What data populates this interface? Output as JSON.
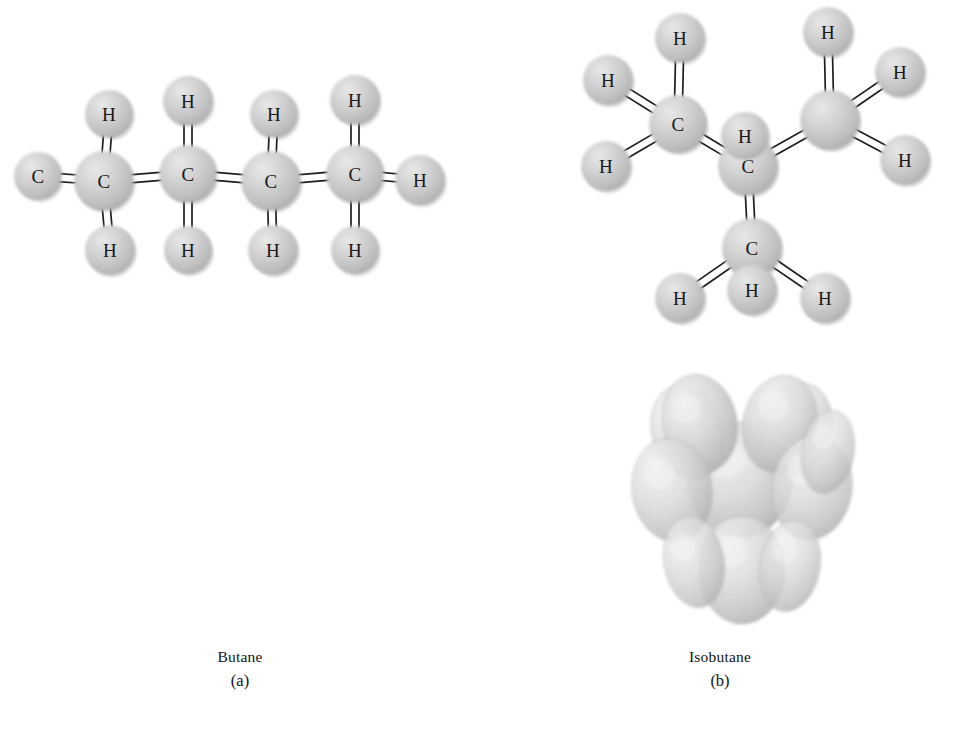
{
  "figure": {
    "background_color": "#ffffff",
    "atom_sphere_color": "#c9c9c9",
    "bond_color": "#ffffff",
    "bond_outline_color": "#1e1e1e",
    "label_color": "#191919"
  },
  "panels": [
    {
      "id": "a",
      "caption_name": "Butane",
      "caption_tag": "(a)",
      "ball_and_stick": {
        "atoms": [
          {
            "element": "C",
            "label": "C",
            "x": 38,
            "y": 176,
            "r": 24,
            "show_label": true
          },
          {
            "element": "C",
            "label": "C",
            "x": 104,
            "y": 181,
            "r": 30,
            "show_label": true
          },
          {
            "element": "C",
            "label": "C",
            "x": 188,
            "y": 174,
            "r": 29,
            "show_label": true
          },
          {
            "element": "C",
            "label": "C",
            "x": 271,
            "y": 181,
            "r": 30,
            "show_label": true
          },
          {
            "element": "C",
            "label": "C",
            "x": 355,
            "y": 174,
            "r": 29,
            "show_label": true
          },
          {
            "element": "H",
            "label": "H",
            "x": 109,
            "y": 114,
            "r": 24,
            "show_label": true
          },
          {
            "element": "H",
            "label": "H",
            "x": 110,
            "y": 250,
            "r": 25,
            "show_label": true
          },
          {
            "element": "H",
            "label": "H",
            "x": 188,
            "y": 101,
            "r": 25,
            "show_label": true
          },
          {
            "element": "H",
            "label": "H",
            "x": 188,
            "y": 250,
            "r": 24,
            "show_label": true
          },
          {
            "element": "H",
            "label": "H",
            "x": 274,
            "y": 114,
            "r": 24,
            "show_label": true
          },
          {
            "element": "H",
            "label": "H",
            "x": 273,
            "y": 250,
            "r": 25,
            "show_label": true
          },
          {
            "element": "H",
            "label": "H",
            "x": 355,
            "y": 100,
            "r": 25,
            "show_label": true
          },
          {
            "element": "H",
            "label": "H",
            "x": 355,
            "y": 250,
            "r": 24,
            "show_label": true
          },
          {
            "element": "H",
            "label": "H",
            "x": 420,
            "y": 180,
            "r": 25,
            "show_label": true
          }
        ],
        "bonds": [
          {
            "from": 0,
            "to": 1
          },
          {
            "from": 1,
            "to": 2
          },
          {
            "from": 2,
            "to": 3
          },
          {
            "from": 3,
            "to": 4
          },
          {
            "from": 1,
            "to": 5
          },
          {
            "from": 1,
            "to": 6
          },
          {
            "from": 2,
            "to": 7
          },
          {
            "from": 2,
            "to": 8
          },
          {
            "from": 3,
            "to": 9
          },
          {
            "from": 3,
            "to": 10
          },
          {
            "from": 4,
            "to": 11
          },
          {
            "from": 4,
            "to": 12
          },
          {
            "from": 4,
            "to": 13
          }
        ]
      },
      "space_filling": {
        "spheres": [
          {
            "cx": 72,
            "cy": 508,
            "rx": 43,
            "ry": 56,
            "rot": -4,
            "shade": 0.5
          },
          {
            "cx": 196,
            "cy": 512,
            "rx": 41,
            "ry": 54,
            "rot": 4,
            "shade": 0.5
          },
          {
            "cx": 133,
            "cy": 503,
            "rx": 52,
            "ry": 54,
            "rot": 0,
            "shade": 0.8
          },
          {
            "cx": 70,
            "cy": 452,
            "rx": 36,
            "ry": 46,
            "rot": 0,
            "shade": 0.66
          },
          {
            "cx": 127,
            "cy": 448,
            "rx": 40,
            "ry": 48,
            "rot": 0,
            "shade": 0.72
          },
          {
            "cx": 172,
            "cy": 448,
            "rx": 32,
            "ry": 44,
            "rot": 0,
            "shade": 0.6
          },
          {
            "cx": 101,
            "cy": 443,
            "rx": 36,
            "ry": 46,
            "rot": 0,
            "shade": 0.86
          },
          {
            "cx": 71,
            "cy": 566,
            "rx": 35,
            "ry": 45,
            "rot": 0,
            "shade": 0.62
          },
          {
            "cx": 128,
            "cy": 570,
            "rx": 38,
            "ry": 46,
            "rot": 0,
            "shade": 0.58
          },
          {
            "cx": 172,
            "cy": 563,
            "rx": 30,
            "ry": 42,
            "rot": 0,
            "shade": 0.56
          },
          {
            "cx": 102,
            "cy": 573,
            "rx": 35,
            "ry": 44,
            "rot": 0,
            "shade": 0.7
          }
        ]
      }
    },
    {
      "id": "b",
      "caption_name": "Isobutane",
      "caption_tag": "(b)",
      "ball_and_stick": {
        "atoms": [
          {
            "element": "C",
            "label": "C",
            "x": 678,
            "y": 124,
            "r": 29,
            "show_label": true
          },
          {
            "element": "C",
            "label": "C",
            "x": 748,
            "y": 166,
            "r": 30,
            "show_label": true
          },
          {
            "element": "C",
            "label": "C",
            "x": 830,
            "y": 120,
            "r": 30,
            "show_label": false
          },
          {
            "element": "C",
            "label": "C",
            "x": 752,
            "y": 248,
            "r": 30,
            "show_label": true
          },
          {
            "element": "H",
            "label": "H",
            "x": 680,
            "y": 38,
            "r": 25,
            "show_label": true
          },
          {
            "element": "H",
            "label": "H",
            "x": 608,
            "y": 80,
            "r": 25,
            "show_label": true
          },
          {
            "element": "H",
            "label": "H",
            "x": 606,
            "y": 166,
            "r": 25,
            "show_label": true
          },
          {
            "element": "H",
            "label": "H",
            "x": 745,
            "y": 136,
            "r": 24,
            "show_label": true
          },
          {
            "element": "H",
            "label": "H",
            "x": 828,
            "y": 32,
            "r": 25,
            "show_label": true
          },
          {
            "element": "H",
            "label": "H",
            "x": 900,
            "y": 72,
            "r": 25,
            "show_label": true
          },
          {
            "element": "H",
            "label": "H",
            "x": 905,
            "y": 160,
            "r": 25,
            "show_label": true
          },
          {
            "element": "H",
            "label": "H",
            "x": 752,
            "y": 290,
            "r": 25,
            "show_label": true
          },
          {
            "element": "H",
            "label": "H",
            "x": 680,
            "y": 298,
            "r": 25,
            "show_label": true
          },
          {
            "element": "H",
            "label": "H",
            "x": 825,
            "y": 298,
            "r": 25,
            "show_label": true
          }
        ],
        "bonds": [
          {
            "from": 0,
            "to": 1
          },
          {
            "from": 1,
            "to": 2
          },
          {
            "from": 1,
            "to": 3
          },
          {
            "from": 0,
            "to": 4
          },
          {
            "from": 0,
            "to": 5
          },
          {
            "from": 0,
            "to": 6
          },
          {
            "from": 1,
            "to": 7
          },
          {
            "from": 2,
            "to": 8
          },
          {
            "from": 2,
            "to": 9
          },
          {
            "from": 2,
            "to": 10
          },
          {
            "from": 3,
            "to": 11
          },
          {
            "from": 3,
            "to": 12
          },
          {
            "from": 3,
            "to": 13
          }
        ]
      },
      "space_filling": {
        "spheres": [
          {
            "cx": 740,
            "cy": 480,
            "rx": 52,
            "ry": 58,
            "rot": 0,
            "shade": 0.82
          },
          {
            "cx": 688,
            "cy": 432,
            "rx": 36,
            "ry": 48,
            "rot": -18,
            "shade": 0.6
          },
          {
            "cx": 795,
            "cy": 430,
            "rx": 36,
            "ry": 48,
            "rot": 18,
            "shade": 0.58
          },
          {
            "cx": 700,
            "cy": 423,
            "rx": 37,
            "ry": 49,
            "rot": -12,
            "shade": 0.8
          },
          {
            "cx": 780,
            "cy": 424,
            "rx": 37,
            "ry": 49,
            "rot": 12,
            "shade": 0.78
          },
          {
            "cx": 672,
            "cy": 490,
            "rx": 40,
            "ry": 52,
            "rot": -8,
            "shade": 0.68
          },
          {
            "cx": 812,
            "cy": 488,
            "rx": 40,
            "ry": 52,
            "rot": 8,
            "shade": 0.64
          },
          {
            "cx": 828,
            "cy": 452,
            "rx": 26,
            "ry": 42,
            "rot": 10,
            "shade": 0.52
          },
          {
            "cx": 742,
            "cy": 570,
            "rx": 43,
            "ry": 54,
            "rot": 0,
            "shade": 0.7
          },
          {
            "cx": 694,
            "cy": 562,
            "rx": 30,
            "ry": 46,
            "rot": -10,
            "shade": 0.55
          },
          {
            "cx": 790,
            "cy": 566,
            "rx": 30,
            "ry": 46,
            "rot": 10,
            "shade": 0.53
          }
        ]
      }
    }
  ]
}
